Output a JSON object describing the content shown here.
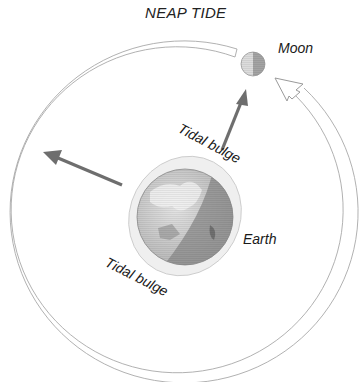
{
  "diagram": {
    "title": "NEAP TIDE",
    "labels": {
      "moon": "Moon",
      "earth": "Earth",
      "tidal_bulge_top": "Tidal bulge",
      "tidal_bulge_bottom": "Tidal bulge"
    },
    "elements": {
      "orbit": "moon-orbit-path",
      "orbit_direction": "counterclockwise-arrow",
      "moon_gravity_arrow": "arrow-toward-moon",
      "sun_direction_arrow": "arrow-toward-sun"
    },
    "colors": {
      "orbit_stroke": "#a8a8a8",
      "arrow_fill": "#6e6e6e",
      "earth_light": "#d6d6d6",
      "earth_dark": "#8a8a8a",
      "bulge_fill": "#ececec",
      "moon_light": "#dcdcdc",
      "moon_dark": "#9a9a9a"
    }
  }
}
